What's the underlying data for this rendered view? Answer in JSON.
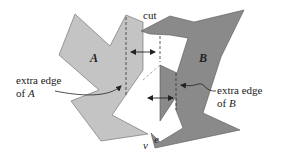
{
  "figure": {
    "colors": {
      "polygon_a": "#c4c4c4",
      "polygon_b": "#8a8a8a",
      "stroke": "#555555",
      "background": "#ffffff",
      "text": "#222222"
    },
    "labels": {
      "polygon_a": "A",
      "polygon_b": "B",
      "cut": "cut",
      "extra_edge_a_line1": "extra edge",
      "extra_edge_a_line2_prefix": "of ",
      "extra_edge_a_line2_var": "A",
      "extra_edge_b_line1": "extra edge",
      "extra_edge_b_line2_prefix": "of ",
      "extra_edge_b_line2_var": "B",
      "vertex_v": "v",
      "edge_e": "e"
    }
  }
}
